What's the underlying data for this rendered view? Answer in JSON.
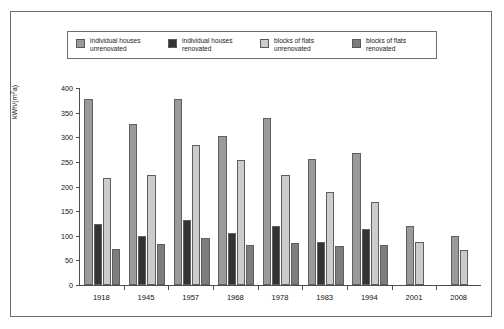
{
  "legend": {
    "items": [
      {
        "label": "individual houses\nunrenovated",
        "color": "#9a9a9a",
        "name": "individual-houses-unrenovated"
      },
      {
        "label": "individual houses\nrenovated",
        "color": "#333333",
        "name": "individual-houses-renovated"
      },
      {
        "label": "blocks of flats\nunrenovated",
        "color": "#cccccc",
        "name": "blocks-of-flats-unrenovated"
      },
      {
        "label": "blocks of flats\nrenovated",
        "color": "#7d7d7d",
        "name": "blocks-of-flats-renovated"
      }
    ]
  },
  "axes": {
    "ylabel_pre": "kWh/(m",
    "ylabel_sup": "2",
    "ylabel_post": "a)",
    "yticks": [
      0,
      50,
      100,
      150,
      200,
      250,
      300,
      350,
      400
    ]
  },
  "chart_data": {
    "type": "bar",
    "title": "",
    "xlabel": "",
    "ylabel": "kWh/(m2a)",
    "ylim": [
      0,
      400
    ],
    "grid": false,
    "legend_position": "top",
    "categories": [
      "1918",
      "1945",
      "1957",
      "1968",
      "1978",
      "1983",
      "1994",
      "2001",
      "2008"
    ],
    "series": [
      {
        "name": "individual houses unrenovated",
        "color": "#9a9a9a",
        "values": [
          378,
          327,
          378,
          303,
          340,
          256,
          268,
          119,
          100
        ]
      },
      {
        "name": "individual houses renovated",
        "color": "#333333",
        "values": [
          124,
          99,
          131,
          106,
          120,
          88,
          114,
          null,
          null
        ]
      },
      {
        "name": "blocks of flats unrenovated",
        "color": "#cccccc",
        "values": [
          218,
          224,
          285,
          254,
          223,
          188,
          169,
          87,
          72
        ]
      },
      {
        "name": "blocks of flats renovated",
        "color": "#7d7d7d",
        "values": [
          74,
          84,
          96,
          81,
          86,
          79,
          82,
          null,
          null
        ]
      }
    ]
  }
}
